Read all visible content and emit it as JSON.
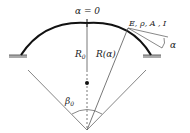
{
  "diagram": {
    "type": "curved beam (arch) with clamped ends",
    "labels": {
      "top": "α = 0",
      "properties": "E, ρ, A , I",
      "angle_alpha": "α",
      "radius_center": "R",
      "radius_center_sub": "0",
      "radius_var": "R(α)",
      "half_angle": "β",
      "half_angle_sub": "0"
    },
    "colors": {
      "beam": "#111111",
      "lines": "#555555",
      "support": "#888888"
    }
  }
}
